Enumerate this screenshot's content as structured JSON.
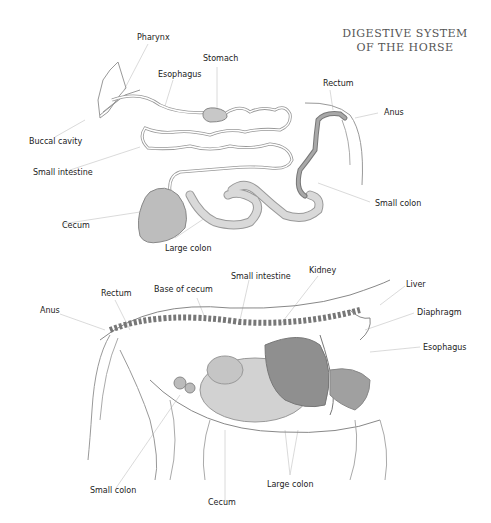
{
  "title": {
    "line1": "DIGESTIVE SYSTEM",
    "line2": "OF THE HORSE"
  },
  "top_diagram": {
    "labels": {
      "pharynx": "Pharynx",
      "stomach": "Stomach",
      "esophagus": "Esophagus",
      "rectum": "Rectum",
      "anus": "Anus",
      "buccal_cavity": "Buccal cavity",
      "small_intestine": "Small intestine",
      "small_colon": "Small colon",
      "cecum": "Cecum",
      "large_colon": "Large colon"
    }
  },
  "bottom_diagram": {
    "labels": {
      "anus": "Anus",
      "rectum": "Rectum",
      "base_of_cecum": "Base of cecum",
      "small_intestine": "Small intestine",
      "kidney": "Kidney",
      "liver": "Liver",
      "diaphragm": "Diaphragm",
      "esophagus": "Esophagus",
      "small_colon": "Small colon",
      "cecum": "Cecum",
      "large_colon": "Large colon"
    }
  },
  "colors": {
    "line": "#888888",
    "leader": "#cccccc",
    "organ_fill": "#bdbdbd",
    "organ_dark": "#8a8a8a",
    "text": "#222222"
  }
}
